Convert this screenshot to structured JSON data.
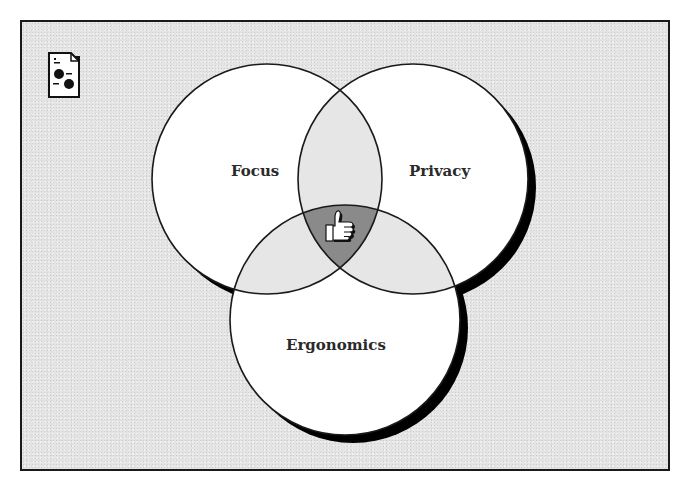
{
  "diagram": {
    "type": "venn",
    "circles": [
      {
        "id": "focus",
        "label": "Focus",
        "cx": 267,
        "cy": 179,
        "r": 115
      },
      {
        "id": "privacy",
        "label": "Privacy",
        "cx": 413,
        "cy": 179,
        "r": 115
      },
      {
        "id": "ergonomics",
        "label": "Ergonomics",
        "cx": 345,
        "cy": 320,
        "r": 115
      }
    ],
    "center_icon": "thumbs-up-icon",
    "corner_icon": "document-icon"
  },
  "colors": {
    "background": "#e4e4e4",
    "circle_fill": "#ffffff",
    "pairwise_overlap": "#e6e6e6",
    "triple_overlap": "#8a8a8a",
    "stroke": "#1a1a1a",
    "shadow": "#000000"
  }
}
